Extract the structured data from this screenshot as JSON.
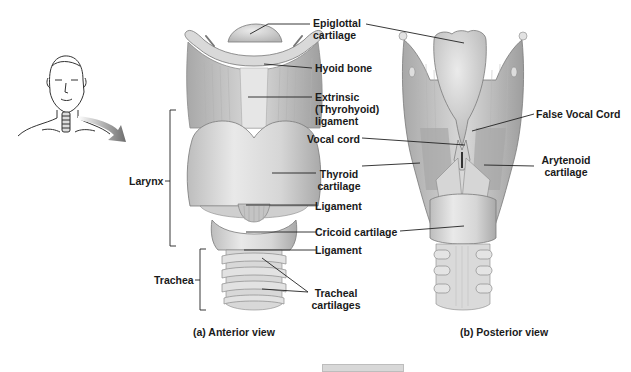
{
  "figure": {
    "inset": {
      "description": "Head and neck outline with arrow pointing to larynx"
    },
    "anterior_view": {
      "caption": "(a) Anterior view",
      "labels": {
        "epiglottal": "Epiglottal",
        "epiglottal2": "cartilage",
        "hyoid": "Hyoid bone",
        "extrinsic1": "Extrinsic",
        "extrinsic2": "(Thyrohyoid)",
        "extrinsic3": "ligament",
        "thyroid1": "Thyroid",
        "thyroid2": "cartilage",
        "ligament1": "Ligament",
        "cricoid": "Cricoid cartilage",
        "ligament2": "Ligament",
        "tracheal1": "Tracheal",
        "tracheal2": "cartilages"
      },
      "brackets": {
        "larynx": "Larynx",
        "trachea": "Trachea"
      }
    },
    "posterior_view": {
      "caption": "(b) Posterior view",
      "labels": {
        "false_vocal": "False Vocal Cord",
        "vocal": "Vocal cord",
        "arytenoid1": "Arytenoid",
        "arytenoid2": "cartilage"
      }
    }
  }
}
